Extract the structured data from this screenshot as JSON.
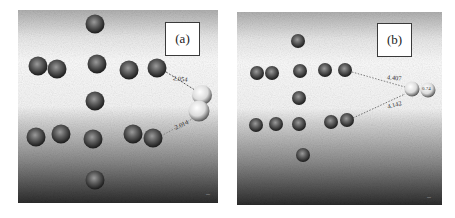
{
  "figure": {
    "panels": [
      {
        "id": "a",
        "label": "(a)",
        "distances": [
          {
            "value": "2.054",
            "from": "atom-row2-right",
            "to": "h2-upper"
          },
          {
            "value": "2.014",
            "from": "atom-row4-right",
            "to": "h2-lower"
          }
        ],
        "metal_atom_count": 14,
        "adsorbate": "H2 (two light spheres, stacked vertically)",
        "scale_marker": "—"
      },
      {
        "id": "b",
        "label": "(b)",
        "distances": [
          {
            "value": "4.407",
            "from": "atom-row2-right",
            "to": "h2-left"
          },
          {
            "value": "4.142",
            "from": "atom-row4-right",
            "to": "h2-left"
          }
        ],
        "metal_atom_count": 14,
        "adsorbate": "H2 (two light spheres, side by side)",
        "h2_bond_label": "0.74",
        "scale_marker": "—"
      }
    ],
    "colors": {
      "metal_atom": "#3c3c3c",
      "hydrogen_atom": "#e6e6e6",
      "background_top": "#b5b5b5",
      "background_mid": "#f2f2f2",
      "background_bottom": "#2a2a2a",
      "bond_line": "#555555"
    }
  }
}
